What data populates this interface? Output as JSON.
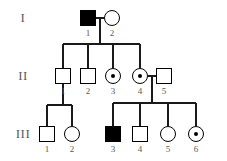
{
  "figure": {
    "type": "pedigree-chart",
    "title": "",
    "background_color": "#ffffff",
    "line_color": "#1a1a1a",
    "label_color": "#5a5a5a",
    "symbol_fill_affected": "#000000",
    "symbol_fill_unaffected": "#ffffff"
  },
  "generations": [
    {
      "label": "I"
    },
    {
      "label": "II"
    },
    {
      "label": "III"
    }
  ],
  "individuals": [
    {
      "id": "I-1",
      "number": "1",
      "sex": "male",
      "shape": "square",
      "status": "affected",
      "x": 88,
      "y": 18
    },
    {
      "id": "I-2",
      "number": "2",
      "sex": "female",
      "shape": "circle",
      "status": "unaffected",
      "x": 112,
      "y": 18
    },
    {
      "id": "II-1",
      "number": "1",
      "sex": "male",
      "shape": "square",
      "status": "unaffected",
      "x": 63,
      "y": 76
    },
    {
      "id": "II-2",
      "number": "2",
      "sex": "male",
      "shape": "square",
      "status": "unaffected",
      "x": 88,
      "y": 76
    },
    {
      "id": "II-3",
      "number": "3",
      "sex": "female",
      "shape": "circle",
      "status": "carrier",
      "x": 113,
      "y": 76
    },
    {
      "id": "II-4",
      "number": "4",
      "sex": "female",
      "shape": "circle",
      "status": "carrier",
      "x": 140,
      "y": 76
    },
    {
      "id": "II-5",
      "number": "5",
      "sex": "male",
      "shape": "square",
      "status": "unaffected",
      "x": 164,
      "y": 76
    },
    {
      "id": "III-1",
      "number": "1",
      "sex": "male",
      "shape": "square",
      "status": "unaffected",
      "x": 47,
      "y": 134
    },
    {
      "id": "III-2",
      "number": "2",
      "sex": "female",
      "shape": "circle",
      "status": "unaffected",
      "x": 72,
      "y": 134
    },
    {
      "id": "III-3",
      "number": "3",
      "sex": "male",
      "shape": "square",
      "status": "affected",
      "x": 113,
      "y": 134
    },
    {
      "id": "III-4",
      "number": "4",
      "sex": "male",
      "shape": "square",
      "status": "unaffected",
      "x": 140,
      "y": 134
    },
    {
      "id": "III-5",
      "number": "5",
      "sex": "female",
      "shape": "circle",
      "status": "unaffected",
      "x": 168,
      "y": 134
    },
    {
      "id": "III-6",
      "number": "6",
      "sex": "female",
      "shape": "circle",
      "status": "carrier",
      "x": 196,
      "y": 134
    }
  ],
  "matings": [
    {
      "partners": [
        "I-1",
        "I-2"
      ],
      "children": [
        "II-1",
        "II-2",
        "II-3",
        "II-4"
      ]
    },
    {
      "partners": [
        "II-4",
        "II-5"
      ],
      "children": [
        "III-3",
        "III-4",
        "III-5",
        "III-6"
      ]
    },
    {
      "partners": [
        "II-1"
      ],
      "children": [
        "III-1",
        "III-2"
      ]
    }
  ],
  "labels": {
    "gen1": "I",
    "gen2": "II",
    "gen3": "III",
    "i1": "1",
    "i2": "2",
    "ii1": "1",
    "ii2": "2",
    "ii3": "3",
    "ii4": "4",
    "ii5": "5",
    "iii1": "1",
    "iii2": "2",
    "iii3": "3",
    "iii4": "4",
    "iii5": "5",
    "iii6": "6"
  }
}
